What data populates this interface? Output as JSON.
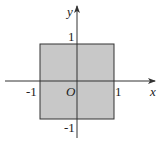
{
  "diagram": {
    "type": "coordinate-plane",
    "axes": {
      "x_label": "x",
      "y_label": "y",
      "origin_label": "O"
    },
    "ticks": {
      "x_neg": "-1",
      "x_pos": "1",
      "y_pos": "1",
      "y_neg": "-1"
    },
    "region": {
      "shape": "square",
      "x_range": [
        -1,
        1
      ],
      "y_range": [
        -1,
        1
      ],
      "fill_color": "#c8c8c8",
      "stroke_color": "#333333"
    },
    "axis_color": "#333333"
  }
}
